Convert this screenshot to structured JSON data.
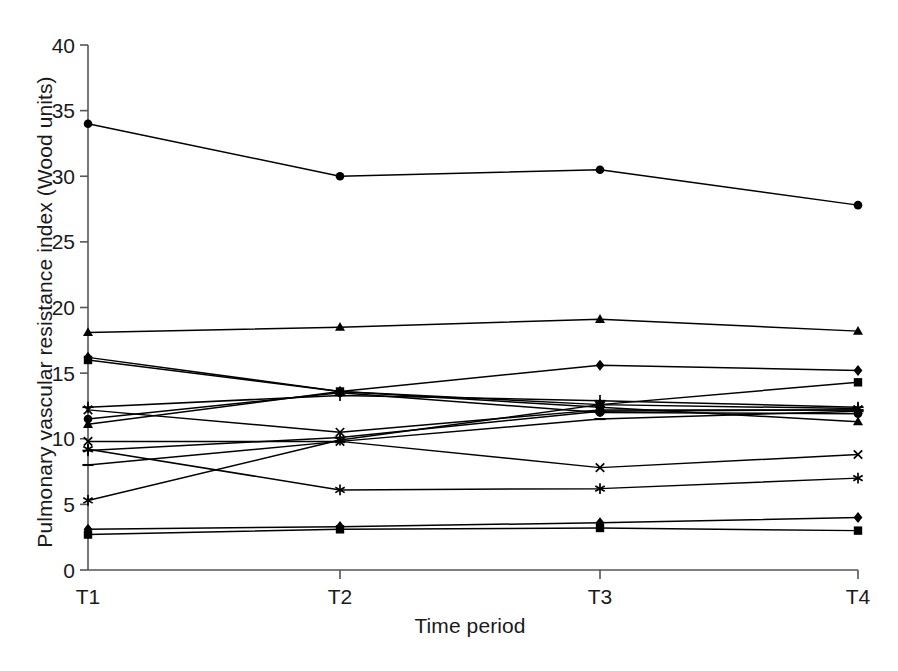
{
  "chart_data": {
    "type": "line",
    "title": "",
    "subtitle": "",
    "xlabel": "Time period",
    "ylabel": "Pulmonary vascular resistance index (Wood units)",
    "categories": [
      "T1",
      "T2",
      "T3",
      "T4"
    ],
    "x_tick_labels": [
      "T1",
      "T2",
      "T3",
      "T4"
    ],
    "y_tick_labels": [
      "0",
      "5",
      "10",
      "15",
      "20",
      "25",
      "30",
      "35",
      "40"
    ],
    "y_ticks": [
      0,
      5,
      10,
      15,
      20,
      25,
      30,
      35,
      40
    ],
    "ylim": [
      0,
      40
    ],
    "grid": false,
    "legend": "none",
    "legend_position": "none",
    "line_color": "#000000",
    "marker_color": "#000000",
    "background_color": "#ffffff",
    "axis_color": "#555555",
    "series": [
      {
        "name": "Patient 1",
        "marker": "circle",
        "values": [
          34.0,
          30.0,
          30.5,
          27.8
        ]
      },
      {
        "name": "Patient 2",
        "marker": "triangle",
        "values": [
          18.1,
          18.5,
          19.1,
          18.2
        ]
      },
      {
        "name": "Patient 3",
        "marker": "diamond",
        "values": [
          16.2,
          13.6,
          15.6,
          15.2
        ]
      },
      {
        "name": "Patient 4",
        "marker": "square",
        "values": [
          16.0,
          13.6,
          12.6,
          14.3
        ]
      },
      {
        "name": "Patient 5",
        "marker": "plus",
        "values": [
          12.4,
          13.3,
          12.9,
          12.4
        ]
      },
      {
        "name": "Patient 6",
        "marker": "cross",
        "values": [
          12.2,
          10.5,
          12.2,
          12.2
        ]
      },
      {
        "name": "Patient 7",
        "marker": "circle",
        "values": [
          11.5,
          13.5,
          12.0,
          11.9
        ]
      },
      {
        "name": "Patient 8",
        "marker": "triangle",
        "values": [
          11.1,
          13.6,
          12.4,
          11.3
        ]
      },
      {
        "name": "Patient 9",
        "marker": "cross",
        "values": [
          9.8,
          9.8,
          7.8,
          8.8
        ]
      },
      {
        "name": "Patient 10",
        "marker": "asterisk",
        "values": [
          9.2,
          6.1,
          6.2,
          7.0
        ]
      },
      {
        "name": "Patient 11",
        "marker": "plus",
        "values": [
          9.1,
          10.1,
          12.1,
          12.2
        ]
      },
      {
        "name": "Patient 12",
        "marker": "line",
        "values": [
          8.0,
          9.8,
          11.5,
          12.1
        ]
      },
      {
        "name": "Patient 13",
        "marker": "asterisk",
        "values": [
          5.3,
          9.9,
          12.6,
          12.3
        ]
      },
      {
        "name": "Patient 14",
        "marker": "diamond",
        "values": [
          3.1,
          3.3,
          3.6,
          4.0
        ]
      },
      {
        "name": "Patient 15",
        "marker": "square",
        "values": [
          2.7,
          3.1,
          3.2,
          3.0
        ]
      }
    ]
  }
}
